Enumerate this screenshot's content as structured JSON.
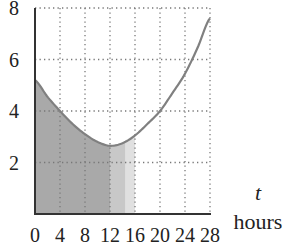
{
  "chart_data": {
    "type": "line",
    "title": "",
    "xlabel": "t",
    "xlabel_unit": "hours",
    "ylabel": "",
    "xlim": [
      0,
      28
    ],
    "ylim": [
      0,
      8
    ],
    "grid": true,
    "grid_style": "dotted",
    "x_ticks": [
      0,
      4,
      8,
      12,
      16,
      20,
      24,
      28
    ],
    "y_ticks": [
      2,
      4,
      6,
      8
    ],
    "series": [
      {
        "name": "curve",
        "color": "#808080",
        "x": [
          0,
          2,
          4,
          6,
          8,
          10,
          12,
          14,
          16,
          18,
          20,
          22,
          24,
          26,
          28
        ],
        "y": [
          5.2,
          4.55,
          4.0,
          3.5,
          3.1,
          2.8,
          2.65,
          2.75,
          3.05,
          3.5,
          4.0,
          4.7,
          5.45,
          6.45,
          7.6
        ]
      }
    ],
    "shaded_regions": [
      {
        "from": 0,
        "to": 12,
        "color": "#a9a9a9",
        "under": "curve"
      },
      {
        "from": 12,
        "to": 14.5,
        "color": "#c8c8c8",
        "under": "curve"
      },
      {
        "from": 14.5,
        "to": 16,
        "color": "#e0e0e0",
        "under": "curve"
      }
    ]
  },
  "labels": {
    "x_var": "t",
    "x_unit": "hours"
  }
}
